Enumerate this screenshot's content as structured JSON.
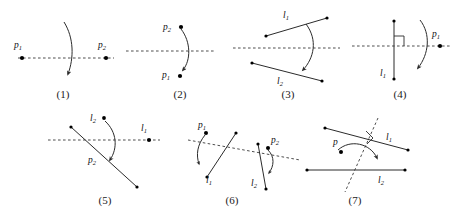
{
  "diagram": {
    "background_color": "#ffffff",
    "stroke_color": "#2b2b2b",
    "dash_color": "#3a3a3a",
    "figures": [
      {
        "id": "fig1",
        "caption": "(1)",
        "description": "Horizontal dashed mirror line with points p1 and p2 and a downward curved arrow crossing it",
        "labels": [
          {
            "name": "p1",
            "base": "p",
            "sub": "1"
          },
          {
            "name": "p2",
            "base": "p",
            "sub": "2"
          }
        ]
      },
      {
        "id": "fig2",
        "caption": "(2)",
        "description": "Horizontal dashed line with point p2 above and point p1 below joined by a curved arrow",
        "labels": [
          {
            "name": "p2",
            "base": "p",
            "sub": "2"
          },
          {
            "name": "p1",
            "base": "p",
            "sub": "1"
          }
        ]
      },
      {
        "id": "fig3",
        "caption": "(3)",
        "description": "Two slanted segments l1 above and l2 below a horizontal dashed line, curved arrow from l1 to l2",
        "labels": [
          {
            "name": "l1",
            "base": "l",
            "sub": "1"
          },
          {
            "name": "l2",
            "base": "l",
            "sub": "2"
          }
        ]
      },
      {
        "id": "fig4",
        "caption": "(4)",
        "description": "Vertical segment l1 perpendicular to a horizontal dashed line with right-angle mark, point p1 at right and a curved arrow",
        "labels": [
          {
            "name": "l1",
            "base": "l",
            "sub": "1"
          },
          {
            "name": "p1",
            "base": "p",
            "sub": "1"
          }
        ]
      },
      {
        "id": "fig5",
        "caption": "(5)",
        "description": "Horizontal dashed line, a long slanted segment p2, label l2 above with a dot, point l1 at right and a downward curved arrow",
        "labels": [
          {
            "name": "l2",
            "base": "l",
            "sub": "2"
          },
          {
            "name": "l1",
            "base": "l",
            "sub": "1"
          },
          {
            "name": "p2",
            "base": "p",
            "sub": "2"
          }
        ]
      },
      {
        "id": "fig6",
        "caption": "(6)",
        "description": "Slanted dashed line crossing two steep segments l1 and l2, with points p1 and p2 and small curved arrows",
        "labels": [
          {
            "name": "p1",
            "base": "p",
            "sub": "1"
          },
          {
            "name": "p2",
            "base": "p",
            "sub": "2"
          },
          {
            "name": "l1",
            "base": "l",
            "sub": "1"
          },
          {
            "name": "l2",
            "base": "l",
            "sub": "2"
          }
        ]
      },
      {
        "id": "fig7",
        "caption": "(7)",
        "description": "Steep dashed line perpendicular to slanted segment l1 with right-angle mark, horizontal segment l2 below, point p at left and a curved arrow from l1 to l2",
        "labels": [
          {
            "name": "l1",
            "base": "l",
            "sub": "1"
          },
          {
            "name": "l2",
            "base": "l",
            "sub": "2"
          },
          {
            "name": "p",
            "base": "p",
            "sub": ""
          }
        ]
      }
    ]
  }
}
